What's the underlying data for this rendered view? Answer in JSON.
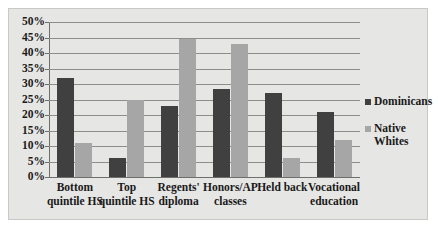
{
  "chart_data": {
    "type": "bar",
    "title": "",
    "xlabel": "",
    "ylabel": "",
    "ylim": [
      0,
      50
    ],
    "y_tick_labels": [
      "50%",
      "45%",
      "40%",
      "35%",
      "30%",
      "25%",
      "20%",
      "15%",
      "10%",
      "5%",
      "0%"
    ],
    "y_tick_values": [
      50,
      45,
      40,
      35,
      30,
      25,
      20,
      15,
      10,
      5,
      0
    ],
    "grid": true,
    "legend_position": "right",
    "categories": [
      "Bottom quintile HS",
      "Top quintile HS",
      "Regents' diploma",
      "Honors/AP classes",
      "Held back",
      "Vocational education"
    ],
    "category_lines": [
      [
        "Bottom",
        "quintile HS"
      ],
      [
        "Top",
        "quintile HS"
      ],
      [
        "Regents'",
        "diploma"
      ],
      [
        "Honors/AP",
        "classes"
      ],
      [
        "Held back",
        ""
      ],
      [
        "Vocational",
        "education"
      ]
    ],
    "series": [
      {
        "name": "Dominicans",
        "color": "#404040",
        "values": [
          32,
          6,
          23,
          28.5,
          27,
          21
        ]
      },
      {
        "name": "Native Whites",
        "color": "#a6a6a6",
        "values": [
          11,
          25,
          44.5,
          43,
          6,
          12
        ]
      }
    ]
  },
  "legend": {
    "items": [
      {
        "label": "Dominicans",
        "line1": "Dominicans",
        "line2": ""
      },
      {
        "label": "Native Whites",
        "line1": "Native",
        "line2": "Whites"
      }
    ]
  }
}
